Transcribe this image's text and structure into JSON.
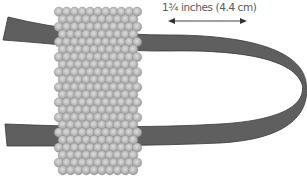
{
  "diagram": {
    "measurement": {
      "label": "1¾ inches (4.4 cm)",
      "arrow": {
        "x1": 169,
        "x2": 246,
        "y": 21
      }
    },
    "bead_panel": {
      "x": 55,
      "y": 8,
      "width": 86,
      "height": 166,
      "columns": 11,
      "rows": 22,
      "bead_fill": "#b8b8b8",
      "bead_highlight": "#d6d6d6",
      "bead_edge": "#8f8f8f"
    },
    "strap": {
      "color": "#5f5f5f",
      "edge_color": "#3c3c3c",
      "fold_side": "right"
    },
    "colors": {
      "background": "#ffffff",
      "text": "#5a5a5a",
      "arrow": "#444444"
    }
  }
}
